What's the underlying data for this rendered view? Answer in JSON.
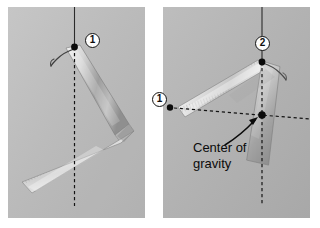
{
  "figure": {
    "type": "photograph-diagram",
    "background_color": "#ffffff",
    "panel_backdrop_color": "#b9b9b9",
    "ink_color": "#111111",
    "metal_color": "#cfcfcf"
  },
  "panels": [
    {
      "id": "panel-left",
      "name": "suspension-point-1",
      "badges": [
        {
          "label": "1",
          "name": "callout-badge-1"
        }
      ],
      "pivot_label": "1",
      "plumb_line_style": "dashed",
      "thread_style": "solid",
      "object": "carpenter-square"
    },
    {
      "id": "panel-right",
      "name": "suspension-point-2",
      "badges": [
        {
          "label": "2",
          "name": "callout-badge-2"
        },
        {
          "label": "1",
          "name": "callout-badge-1-repeat"
        }
      ],
      "pivot_label": "2",
      "plumb_line_style": "dashed",
      "thread_style": "solid",
      "object": "carpenter-square"
    }
  ],
  "annotations": {
    "center_of_gravity": {
      "line1": "Center of",
      "line2": "gravity",
      "arrow": "curved-arrow-up-right"
    }
  }
}
